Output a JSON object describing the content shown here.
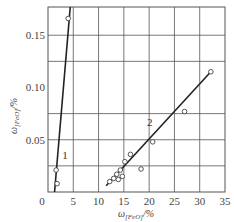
{
  "chart_data": {
    "type": "scatter",
    "title": "",
    "xlabel": "ω(FeO)/%",
    "ylabel": "ω(FeO)/%",
    "xlabel_display": "ω",
    "xlabel_sub": "[FeO]",
    "xlabel_unit": "/%",
    "ylabel_display": "ω",
    "ylabel_sub": "[FeO]",
    "ylabel_unit": "/%",
    "xlim": [
      0,
      35
    ],
    "ylim": [
      0,
      0.177
    ],
    "x_ticks": [
      0,
      5,
      10,
      15,
      20,
      25,
      30,
      35
    ],
    "x_tick_labels": [
      "0",
      "5",
      "10",
      "15",
      "20",
      "25",
      "30",
      "35"
    ],
    "y_ticks": [
      0.05,
      0.1,
      0.15
    ],
    "y_tick_labels": [
      "0.05",
      "0.10",
      "0.15"
    ],
    "grid": true,
    "h_gridlines": [
      0.025,
      0.05,
      0.075,
      0.125,
      0.15
    ],
    "v_gridlines": [
      5,
      10,
      15,
      20,
      25,
      30
    ],
    "legend": null,
    "series": [
      {
        "name": "1",
        "label_pos": {
          "x": 2.8,
          "y": 0.032
        },
        "points": [
          {
            "x": 1.8,
            "y": 0.008
          },
          {
            "x": 1.6,
            "y": 0.021
          },
          {
            "x": 4.0,
            "y": 0.166
          }
        ],
        "fit_line": {
          "x1": 1.3,
          "y1": 0.0,
          "x2": 4.4,
          "y2": 0.177
        }
      },
      {
        "name": "2",
        "label_pos": {
          "x": 19.6,
          "y": 0.063
        },
        "points": [
          {
            "x": 12.2,
            "y": 0.01
          },
          {
            "x": 13.0,
            "y": 0.013
          },
          {
            "x": 13.6,
            "y": 0.017
          },
          {
            "x": 13.9,
            "y": 0.012
          },
          {
            "x": 14.3,
            "y": 0.021
          },
          {
            "x": 14.7,
            "y": 0.015
          },
          {
            "x": 15.2,
            "y": 0.029
          },
          {
            "x": 16.3,
            "y": 0.036
          },
          {
            "x": 18.4,
            "y": 0.022
          },
          {
            "x": 20.7,
            "y": 0.048
          },
          {
            "x": 27.0,
            "y": 0.077
          },
          {
            "x": 32.2,
            "y": 0.115
          }
        ],
        "fit_line": {
          "x1": 11.5,
          "y1": 0.006,
          "x2": 32.2,
          "y2": 0.115
        }
      }
    ]
  },
  "colors": {
    "line": "#222222",
    "grid": "#555555",
    "marker_fill": "#ffffff",
    "marker_stroke": "#444444"
  }
}
